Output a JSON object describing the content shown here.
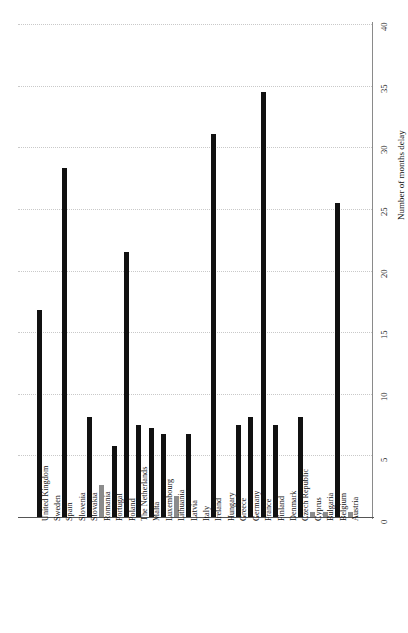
{
  "chart_data": {
    "type": "bar",
    "title": "",
    "subtitle": "",
    "xlabel": "",
    "ylabel": "Number of months delay",
    "orientation": "vertical",
    "grid": true,
    "grid_style": "dotted horizontal gridlines",
    "legend": "none",
    "ylim": [
      0,
      40
    ],
    "yticks": [
      0,
      5,
      10,
      15,
      20,
      25,
      30,
      35,
      40
    ],
    "ytick_labels": [
      "0",
      "5",
      "10",
      "15",
      "20",
      "25",
      "30",
      "35",
      "40"
    ],
    "value_axis_position": "right",
    "category_axis_position": "bottom",
    "colors": {
      "bar_dark": "#111111",
      "bar_gray": "#8c8c8c",
      "gridline": "#c9c9c9",
      "axis": "#555555",
      "background": "#ffffff"
    },
    "categories": [
      "United Kingdom",
      "Sweden",
      "Spain",
      "Slovenia",
      "Slovakia",
      "Romania",
      "Portugal",
      "Poland",
      "The Netherlands",
      "Malta",
      "Luxembourg",
      "Lithuania",
      "Latvia",
      "Italy",
      "Ireland",
      "Hungary",
      "Greece",
      "Germany",
      "France",
      "Finland",
      "Denmark",
      "Czech Republic",
      "Cyprus",
      "Bulgaria",
      "Belgium",
      "Austria"
    ],
    "values": [
      16.8,
      0,
      28.3,
      0,
      8.1,
      2.6,
      5.8,
      21.5,
      7.5,
      7.2,
      6.7,
      1.7,
      6.7,
      0,
      31.1,
      0,
      7.5,
      8.1,
      34.5,
      7.5,
      0,
      8.1,
      0.4,
      0.4,
      25.5,
      0.4
    ],
    "bar_colors": [
      "dark",
      "dark",
      "dark",
      "dark",
      "dark",
      "gray",
      "dark",
      "dark",
      "dark",
      "dark",
      "dark",
      "gray",
      "dark",
      "dark",
      "dark",
      "dark",
      "dark",
      "dark",
      "dark",
      "dark",
      "dark",
      "dark",
      "gray",
      "gray",
      "dark",
      "gray"
    ]
  }
}
